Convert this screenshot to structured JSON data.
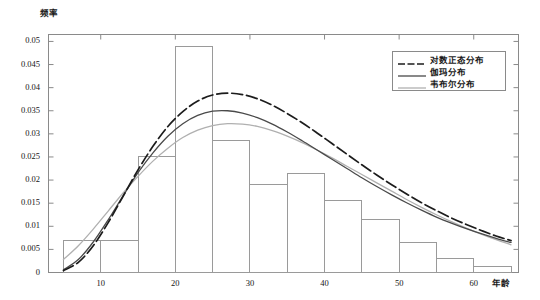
{
  "chart_data": {
    "type": "bar",
    "title": "",
    "xlabel": "年龄",
    "ylabel": "频率",
    "xlim": [
      3,
      66
    ],
    "ylim": [
      0,
      0.0515
    ],
    "grid": false,
    "legend_position": "upper-right",
    "x_ticks": [
      "10",
      "20",
      "30",
      "40",
      "50",
      "60"
    ],
    "x_tick_values": [
      10,
      20,
      30,
      40,
      50,
      60
    ],
    "y_ticks": [
      "0",
      "0.005",
      "0.01",
      "0.015",
      "0.02",
      "0.025",
      "0.03",
      "0.035",
      "0.04",
      "0.045",
      "0.05"
    ],
    "y_tick_values": [
      0,
      0.005,
      0.01,
      0.015,
      0.02,
      0.025,
      0.03,
      0.035,
      0.04,
      0.045,
      0.05
    ],
    "histogram": {
      "name": "年龄频率直方图",
      "bin_edges": [
        5,
        10,
        15,
        20,
        25,
        30,
        35,
        40,
        45,
        50,
        55,
        60,
        65
      ],
      "bin_labels": [
        "5-10",
        "10-15",
        "15-20",
        "20-25",
        "25-30",
        "30-35",
        "35-40",
        "40-45",
        "45-50",
        "50-55",
        "55-60",
        "60-65"
      ],
      "values": [
        0.007,
        0.007,
        0.025,
        0.049,
        0.0285,
        0.019,
        0.0215,
        0.0155,
        0.0115,
        0.0065,
        0.003,
        0.0012
      ],
      "edge_color": "#9a9a9a",
      "fill_color": "#ffffff"
    },
    "series": [
      {
        "name": "对数正态分布",
        "style": "dashdot",
        "color": "#1c1c1c",
        "x": [
          5,
          7,
          9,
          11,
          13,
          15,
          17,
          19,
          21,
          23,
          25,
          27,
          29,
          31,
          33,
          35,
          37,
          39,
          41,
          43,
          45,
          47,
          49,
          51,
          53,
          55,
          57,
          59,
          61,
          63,
          65
        ],
        "values": [
          0.0004,
          0.0022,
          0.0058,
          0.0108,
          0.0165,
          0.0222,
          0.0273,
          0.0316,
          0.0348,
          0.0371,
          0.0384,
          0.0388,
          0.0385,
          0.0376,
          0.0362,
          0.0344,
          0.0324,
          0.0302,
          0.0279,
          0.0256,
          0.0233,
          0.0211,
          0.019,
          0.017,
          0.0151,
          0.0134,
          0.0118,
          0.0104,
          0.0091,
          0.0079,
          0.0069
        ]
      },
      {
        "name": "伽玛分布",
        "style": "solid",
        "color": "#4a4a4a",
        "x": [
          5,
          7,
          9,
          11,
          13,
          15,
          17,
          19,
          21,
          23,
          25,
          27,
          29,
          31,
          33,
          35,
          37,
          39,
          41,
          43,
          45,
          47,
          49,
          51,
          53,
          55,
          57,
          59,
          61,
          63,
          65
        ],
        "values": [
          0.0006,
          0.0028,
          0.0066,
          0.0114,
          0.0166,
          0.0216,
          0.0259,
          0.0295,
          0.0322,
          0.034,
          0.0349,
          0.035,
          0.0345,
          0.0335,
          0.0321,
          0.0304,
          0.0285,
          0.0265,
          0.0245,
          0.0225,
          0.0205,
          0.0186,
          0.0168,
          0.0151,
          0.0135,
          0.012,
          0.0107,
          0.0095,
          0.0084,
          0.0074,
          0.0065
        ]
      },
      {
        "name": "韦布尔分布",
        "style": "solid",
        "color": "#b0b0b0",
        "x": [
          5,
          7,
          9,
          11,
          13,
          15,
          17,
          19,
          21,
          23,
          25,
          27,
          29,
          31,
          33,
          35,
          37,
          39,
          41,
          43,
          45,
          47,
          49,
          51,
          53,
          55,
          57,
          59,
          61,
          63,
          65
        ],
        "values": [
          0.0028,
          0.0058,
          0.0094,
          0.0133,
          0.0172,
          0.0208,
          0.0241,
          0.0269,
          0.0292,
          0.0308,
          0.0318,
          0.0322,
          0.0321,
          0.0316,
          0.0307,
          0.0295,
          0.0281,
          0.0265,
          0.0248,
          0.023,
          0.0212,
          0.0194,
          0.0176,
          0.0158,
          0.0141,
          0.0125,
          0.011,
          0.0096,
          0.0083,
          0.0071,
          0.006
        ]
      }
    ]
  },
  "axes": {
    "y_title": "频率",
    "x_title": "年龄"
  },
  "legend": {
    "entries": [
      {
        "label": "对数正态分布",
        "style": "dashdot",
        "color": "#1c1c1c"
      },
      {
        "label": "伽玛分布",
        "style": "solid",
        "color": "#4a4a4a"
      },
      {
        "label": "韦布尔分布",
        "style": "solid",
        "color": "#b0b0b0"
      }
    ]
  },
  "colors": {
    "axis": "#8a8a8a",
    "text": "#151515",
    "background": "#ffffff"
  }
}
